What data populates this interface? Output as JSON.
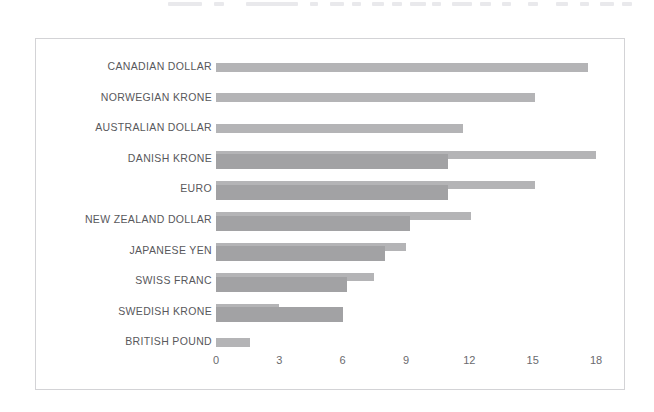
{
  "chart_data": {
    "type": "bar",
    "orientation": "horizontal",
    "title": "",
    "subtitle": "",
    "xlabel": "",
    "ylabel": "",
    "xlim": [
      0,
      18
    ],
    "xticks": [
      0,
      3,
      6,
      9,
      12,
      15,
      18
    ],
    "xtick_labels": [
      "0",
      "3",
      "6",
      "9",
      "12",
      "15",
      "18"
    ],
    "grid": false,
    "legend": "none",
    "categories": [
      "CANADIAN DOLLAR",
      "NORWEGIAN KRONE",
      "AUSTRALIAN DOLLAR",
      "DANISH KRONE",
      "EURO",
      "NEW ZEALAND DOLLAR",
      "JAPANESE YEN",
      "SWISS FRANC",
      "SWEDISH KRONE",
      "BRITISH POUND"
    ],
    "series": [
      {
        "name": "series-1",
        "color": "#b4b4b6",
        "values": [
          17.6,
          15.1,
          11.7,
          18.0,
          15.1,
          12.1,
          9.0,
          7.5,
          3.0,
          1.6
        ]
      },
      {
        "name": "series-2",
        "color": "#a2a2a4",
        "values": [
          0,
          0,
          0,
          11.0,
          11.0,
          9.2,
          8.0,
          6.2,
          6.0,
          0
        ]
      }
    ],
    "colors": {
      "bar_light": "#b4b4b6",
      "bar_dark": "#a2a2a4",
      "frame": "#d3d3d6",
      "label_text": "#58585c",
      "tick_text": "#6a6a6e",
      "background": "#ffffff"
    }
  },
  "rows": [
    {
      "label": "CANADIAN DOLLAR",
      "back": 17.6,
      "front": 0
    },
    {
      "label": "NORWEGIAN KRONE",
      "back": 15.1,
      "front": 0
    },
    {
      "label": "AUSTRALIAN DOLLAR",
      "back": 11.7,
      "front": 0
    },
    {
      "label": "DANISH KRONE",
      "back": 18.0,
      "front": 11.0
    },
    {
      "label": "EURO",
      "back": 15.1,
      "front": 11.0
    },
    {
      "label": "NEW ZEALAND DOLLAR",
      "back": 12.1,
      "front": 9.2
    },
    {
      "label": "JAPANESE YEN",
      "back": 9.0,
      "front": 8.0
    },
    {
      "label": "SWISS FRANC",
      "back": 7.5,
      "front": 6.2
    },
    {
      "label": "SWEDISH KRONE",
      "back": 3.0,
      "front": 6.0
    },
    {
      "label": "BRITISH POUND",
      "back": 1.6,
      "front": 0
    }
  ]
}
